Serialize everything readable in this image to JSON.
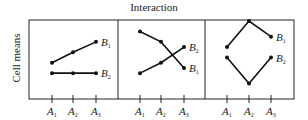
{
  "title": "Interaction",
  "ylabel": "Cell means",
  "chart_data": {
    "type": "line",
    "title": "Interaction",
    "ylabel": "Cell means",
    "xlabel": "",
    "categories": [
      "A1",
      "A2",
      "A3"
    ],
    "grid": false,
    "panels": [
      {
        "name": "panel-1",
        "series": [
          {
            "name": "B1",
            "values": [
              3,
              4,
              5
            ]
          },
          {
            "name": "B2",
            "values": [
              2,
              2,
              2
            ]
          }
        ]
      },
      {
        "name": "panel-2",
        "series": [
          {
            "name": "B1",
            "values": [
              6,
              5,
              2.5
            ]
          },
          {
            "name": "B2",
            "values": [
              2,
              3,
              4.5
            ]
          }
        ]
      },
      {
        "name": "panel-3",
        "series": [
          {
            "name": "B1",
            "values": [
              4.5,
              7,
              5.5
            ]
          },
          {
            "name": "B2",
            "values": [
              3.5,
              1,
              3.5
            ]
          }
        ]
      }
    ]
  },
  "ticks": [
    "A",
    "A",
    "A"
  ],
  "tick_subs": [
    "1",
    "2",
    "3"
  ],
  "series_labels": {
    "b": "B",
    "b1_sub": "1",
    "b2_sub": "2"
  }
}
